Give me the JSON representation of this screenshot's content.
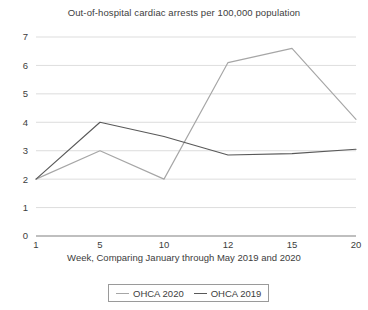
{
  "chart_data": {
    "type": "line",
    "title": "Out-of-hospital cardiac arrests per 100,000 population",
    "xlabel": "Week, Comparing January through May 2019 and 2020",
    "ylabel": "",
    "categories": [
      "1",
      "5",
      "10",
      "12",
      "15",
      "20"
    ],
    "ylim": [
      0,
      7
    ],
    "yticks": [
      "0",
      "1",
      "2",
      "3",
      "4",
      "5",
      "6",
      "7"
    ],
    "grid": true,
    "legend_position": "bottom",
    "series": [
      {
        "name": "OHCA 2020",
        "color": "#a6a6a6",
        "values": [
          2.0,
          3.0,
          2.0,
          6.1,
          6.6,
          4.1
        ]
      },
      {
        "name": "OHCA 2019",
        "color": "#595959",
        "values": [
          2.0,
          4.0,
          3.5,
          2.85,
          2.9,
          3.05
        ]
      }
    ]
  },
  "colors": {
    "gridline": "#d4d4d4",
    "axis": "#808080",
    "text": "#3d3d3d",
    "legend_border": "#9a9a9a"
  }
}
